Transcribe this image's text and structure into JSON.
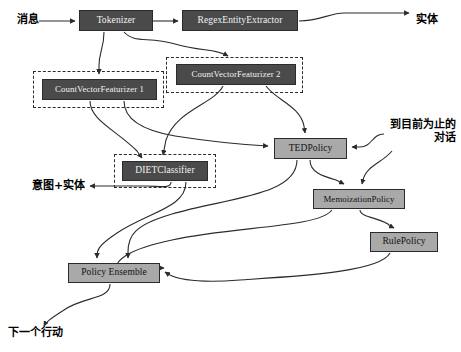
{
  "diagram": {
    "canvas": {
      "width": 461,
      "height": 352
    },
    "colors": {
      "dark_node_fill": "#4a4a4a",
      "dark_node_text": "#f2f2f2",
      "light_node_fill": "#a9a9a9",
      "light_node_text": "#111111",
      "stroke": "#2b2b2b",
      "background": "#ffffff"
    },
    "nodes": [
      {
        "id": "tokenizer",
        "label": "Tokenizer",
        "style": "dark",
        "x": 79,
        "y": 10,
        "w": 74,
        "h": 21
      },
      {
        "id": "regex_entity_extractor",
        "label": "RegexEntityExtractor",
        "style": "dark",
        "x": 182,
        "y": 10,
        "w": 116,
        "h": 21
      },
      {
        "id": "count_vector_featurizer_2",
        "label": "CountVectorFeaturizer 2",
        "style": "dark",
        "x": 176,
        "y": 64,
        "w": 120,
        "h": 21
      },
      {
        "id": "count_vector_featurizer_1",
        "label": "CountVectorFeaturizer 1",
        "style": "dark",
        "x": 42,
        "y": 79,
        "w": 115,
        "h": 21
      },
      {
        "id": "ted_policy",
        "label": "TEDPolicy",
        "style": "light",
        "x": 274,
        "y": 138,
        "w": 73,
        "h": 21
      },
      {
        "id": "diet_classifier",
        "label": "DIETClassifier",
        "style": "dark",
        "x": 122,
        "y": 161,
        "w": 86,
        "h": 20
      },
      {
        "id": "memoization_policy",
        "label": "MemoizationPolicy",
        "style": "light",
        "x": 313,
        "y": 189,
        "w": 92,
        "h": 20
      },
      {
        "id": "rule_policy",
        "label": "RulePolicy",
        "style": "light",
        "x": 370,
        "y": 232,
        "w": 68,
        "h": 20
      },
      {
        "id": "policy_ensemble",
        "label": "Policy Ensemble",
        "style": "light",
        "x": 68,
        "y": 263,
        "w": 92,
        "h": 20
      }
    ],
    "dashed_groups": [
      {
        "id": "group_cvf1",
        "for": "count_vector_featurizer_1",
        "x": 33,
        "y": 71,
        "w": 131,
        "h": 37
      },
      {
        "id": "group_cvf2",
        "for": "count_vector_featurizer_2",
        "x": 166,
        "y": 57,
        "w": 137,
        "h": 36
      },
      {
        "id": "group_diet",
        "for": "diet_classifier",
        "x": 114,
        "y": 154,
        "w": 102,
        "h": 34
      }
    ],
    "external_labels": [
      {
        "id": "input_message",
        "text": "消息",
        "x": 17,
        "y": 14
      },
      {
        "id": "output_entities",
        "text": "实体",
        "x": 416,
        "y": 14
      },
      {
        "id": "input_conversation_so_far",
        "text": "到目前为止的对话",
        "x": 384,
        "y": 119,
        "lines": 2
      },
      {
        "id": "output_intent_entities",
        "text": "意图+实体",
        "x": 32,
        "y": 181
      },
      {
        "id": "output_next_action",
        "text": "下一个行动",
        "x": 8,
        "y": 327
      }
    ],
    "edges": [
      {
        "from": "input_message",
        "to": "tokenizer"
      },
      {
        "from": "tokenizer",
        "to": "regex_entity_extractor"
      },
      {
        "from": "regex_entity_extractor",
        "to": "output_entities"
      },
      {
        "from": "tokenizer",
        "to": "count_vector_featurizer_1"
      },
      {
        "from": "tokenizer",
        "to": "count_vector_featurizer_2"
      },
      {
        "from": "count_vector_featurizer_1",
        "to": "diet_classifier"
      },
      {
        "from": "count_vector_featurizer_1",
        "to": "ted_policy"
      },
      {
        "from": "count_vector_featurizer_2",
        "to": "diet_classifier"
      },
      {
        "from": "count_vector_featurizer_2",
        "to": "ted_policy"
      },
      {
        "from": "diet_classifier",
        "to": "output_intent_entities"
      },
      {
        "from": "diet_classifier",
        "to": "policy_ensemble"
      },
      {
        "from": "input_conversation_so_far",
        "to": "ted_policy"
      },
      {
        "from": "input_conversation_so_far",
        "to": "memoization_policy"
      },
      {
        "from": "ted_policy",
        "to": "memoization_policy"
      },
      {
        "from": "ted_policy",
        "to": "policy_ensemble"
      },
      {
        "from": "memoization_policy",
        "to": "rule_policy"
      },
      {
        "from": "memoization_policy",
        "to": "policy_ensemble"
      },
      {
        "from": "rule_policy",
        "to": "policy_ensemble"
      },
      {
        "from": "policy_ensemble",
        "to": "output_next_action"
      }
    ]
  }
}
